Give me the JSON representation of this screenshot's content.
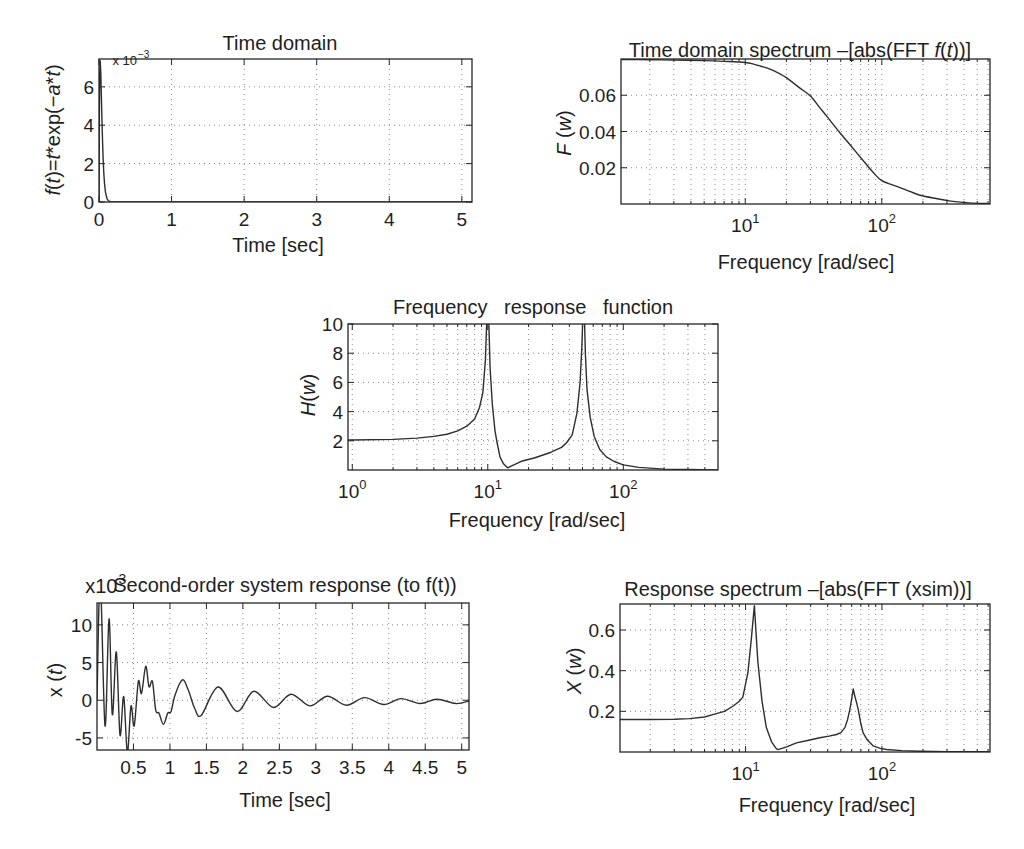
{
  "style": {
    "background": "#ffffff",
    "line_color": "#2e2e2e",
    "axes_color": "#262626",
    "grid_color": "#8a8a8a",
    "text_color": "#1e1e1e"
  },
  "chart_data": [
    {
      "id": "time-domain",
      "type": "line",
      "title": "Time domain",
      "title_rich": [
        [
          "Time domain",
          0
        ]
      ],
      "xlabel": "Time [sec]",
      "ylabel": "f(t)=t*exp(−a*t)",
      "ylabel_rich": [
        [
          "f",
          1
        ],
        [
          "(",
          0
        ],
        [
          "t",
          1
        ],
        [
          ")=",
          0
        ],
        [
          "t",
          1
        ],
        [
          "*exp(−",
          0
        ],
        [
          "a",
          1
        ],
        [
          "*",
          0
        ],
        [
          "t",
          1
        ],
        [
          ")",
          0
        ]
      ],
      "y_multiplier": {
        "base": "x 10",
        "exp": "−3"
      },
      "xscale": "linear",
      "yscale": "linear",
      "xlim": [
        0,
        5.14
      ],
      "ylim": [
        0,
        7.45
      ],
      "xticks": [
        0,
        1,
        2,
        3,
        4,
        5
      ],
      "xticklabels": [
        "0",
        "1",
        "2",
        "3",
        "4",
        "5"
      ],
      "yticks": [
        0,
        2,
        4,
        6
      ],
      "yticklabels": [
        "0",
        "2",
        "4",
        "6"
      ],
      "grid": true,
      "series": [
        {
          "name": "f(t) (x10^-3)",
          "smooth": false,
          "x": [
            0,
            0.005,
            0.01,
            0.0167,
            0.025,
            0.035,
            0.045,
            0.055,
            0.065,
            0.075,
            0.09,
            0.11,
            0.13,
            0.16,
            0.2,
            0.3,
            1,
            2,
            3,
            4,
            5,
            5.14
          ],
          "y": [
            0,
            4.47,
            6.62,
            7.36,
            6.73,
            5.17,
            3.65,
            2.45,
            1.59,
            1.0,
            0.49,
            0.18,
            0.064,
            0.013,
            0.002,
            0,
            0,
            0,
            0,
            0,
            0,
            0
          ]
        }
      ]
    },
    {
      "id": "time-domain-spectrum",
      "type": "line",
      "title": "Time domain spectrum –[abs(FFT f(t))]",
      "title_rich": [
        [
          "Time domain spectrum –[abs(FFT ",
          0
        ],
        [
          "f",
          1
        ],
        [
          "(",
          0
        ],
        [
          "t",
          1
        ],
        [
          "))]",
          0
        ]
      ],
      "xlabel": "Frequency [rad/sec]",
      "ylabel": "F (w)",
      "ylabel_rich": [
        [
          "F",
          1
        ],
        [
          " (",
          0
        ],
        [
          "w",
          1
        ],
        [
          ")",
          0
        ]
      ],
      "xscale": "log",
      "yscale": "linear",
      "xlim": [
        1.23,
        620
      ],
      "ylim": [
        0,
        0.08
      ],
      "xticks": [
        10,
        100
      ],
      "xticklabels": [
        {
          "base": "10",
          "exp": "1"
        },
        {
          "base": "10",
          "exp": "2"
        }
      ],
      "yticks": [
        0.02,
        0.04,
        0.06
      ],
      "yticklabels": [
        "0.02",
        "0.04",
        "0.06"
      ],
      "grid": true,
      "series": [
        {
          "name": "F(w)",
          "smooth": true,
          "x": [
            1.23,
            2,
            3,
            5,
            7,
            10,
            11.5,
            13,
            15,
            17.5,
            20,
            25,
            30,
            35,
            40,
            49,
            60,
            75,
            86,
            100,
            130,
            160,
            191,
            250,
            320,
            437,
            620
          ],
          "y": [
            0.0797,
            0.0796,
            0.0794,
            0.0791,
            0.0787,
            0.0781,
            0.0772,
            0.076,
            0.0745,
            0.0722,
            0.0697,
            0.0641,
            0.0596,
            0.0533,
            0.0479,
            0.0396,
            0.0317,
            0.0229,
            0.0176,
            0.0129,
            0.0096,
            0.007,
            0.0048,
            0.003,
            0.0016,
            0.0006,
            0.0002
          ]
        }
      ]
    },
    {
      "id": "frequency-response-function",
      "type": "line",
      "title": "Frequency   response   function",
      "title_rich": [
        [
          "Frequency   response   function",
          0
        ]
      ],
      "xlabel": "Frequency [rad/sec]",
      "ylabel": "H(w)",
      "ylabel_rich": [
        [
          "H",
          1
        ],
        [
          "(",
          0
        ],
        [
          "w",
          1
        ],
        [
          ")",
          0
        ]
      ],
      "xscale": "log",
      "yscale": "linear",
      "xlim": [
        0.93,
        500
      ],
      "ylim": [
        0,
        10
      ],
      "xticks": [
        1,
        10,
        100
      ],
      "xticklabels": [
        {
          "base": "10",
          "exp": "0"
        },
        {
          "base": "10",
          "exp": "1"
        },
        {
          "base": "10",
          "exp": "2"
        }
      ],
      "yticks": [
        2,
        4,
        6,
        8,
        10
      ],
      "yticklabels": [
        "2",
        "4",
        "6",
        "8",
        "10"
      ],
      "grid": true,
      "series": [
        {
          "name": "H(w)",
          "smooth": false,
          "x": [
            0.93,
            1,
            2,
            3,
            4,
            5,
            6,
            7,
            8,
            8.7,
            9.2,
            9.6,
            9.85,
            10,
            10.15,
            10.4,
            10.8,
            11.3,
            11.7,
            12.3,
            13,
            14,
            15,
            16,
            18,
            22,
            29,
            35,
            38,
            42,
            45.5,
            48,
            49.5,
            50.5,
            51,
            51.5,
            52.5,
            54,
            57,
            61,
            67,
            75,
            85,
            100,
            130,
            200,
            300,
            500
          ],
          "y": [
            2.05,
            2.05,
            2.1,
            2.18,
            2.3,
            2.45,
            2.68,
            3.0,
            3.5,
            4.3,
            5.3,
            7.5,
            10.5,
            16,
            10.5,
            7,
            4.5,
            2.7,
            1.9,
            0.9,
            0.45,
            0.15,
            0.28,
            0.4,
            0.62,
            0.82,
            1.2,
            1.55,
            1.85,
            2.4,
            3.9,
            6,
            8.5,
            11,
            16,
            11,
            8,
            5.5,
            3.6,
            2.3,
            1.4,
            0.9,
            0.6,
            0.35,
            0.18,
            0.06,
            0.03,
            0.01
          ]
        }
      ]
    },
    {
      "id": "second-order-system-response",
      "type": "line",
      "title": "Second-order system response (to f(t))",
      "title_rich": [
        [
          "Second-order system response (to f(t))",
          0
        ]
      ],
      "title_prefix": {
        "base": "x10",
        "exp": "3"
      },
      "xlabel": "Time [sec]",
      "ylabel": "x (t)",
      "ylabel_rich": [
        [
          "x (",
          0
        ],
        [
          "t",
          1
        ],
        [
          ")",
          0
        ]
      ],
      "xscale": "linear",
      "yscale": "linear",
      "xlim": [
        0,
        5.1
      ],
      "ylim": [
        -6.6,
        12.9
      ],
      "xticks": [
        0.5,
        1,
        1.5,
        2,
        2.5,
        3,
        3.5,
        4,
        4.5,
        5
      ],
      "xticklabels": [
        "0.5",
        "1",
        "1.5",
        "2",
        "2.5",
        "3",
        "3.5",
        "4",
        "4.5",
        "5"
      ],
      "yticks": [
        -5,
        0,
        5,
        10
      ],
      "yticklabels": [
        "-5",
        "0",
        "5",
        "10"
      ],
      "grid": true,
      "series": [
        {
          "name": "x(t) (x10^3)",
          "smooth": true,
          "x": [
            0,
            0.045,
            0.11,
            0.165,
            0.21,
            0.265,
            0.315,
            0.366,
            0.416,
            0.466,
            0.51,
            0.567,
            0.61,
            0.668,
            0.713,
            0.76,
            0.805,
            0.85,
            0.91,
            0.97,
            1.015,
            1.07,
            1.17,
            1.25,
            1.34,
            1.43,
            1.66,
            1.92,
            2.15,
            2.42,
            2.66,
            2.92,
            3.16,
            3.42,
            3.67,
            3.93,
            4.17,
            4.43,
            4.66,
            4.92,
            5.1
          ],
          "y": [
            0,
            16,
            -3.4,
            10.8,
            -1.9,
            6.4,
            -4.6,
            0.5,
            -6.9,
            -0.8,
            -3.4,
            2.5,
            0.9,
            4.5,
            1.8,
            2.5,
            -1.3,
            -1.7,
            -3.2,
            -1.7,
            -1.5,
            0.7,
            2.7,
            1.4,
            -1.1,
            -2.0,
            1.75,
            -1.5,
            1.2,
            -0.96,
            0.8,
            -0.75,
            0.53,
            -0.66,
            0.35,
            -0.57,
            0.22,
            -0.44,
            0.13,
            -0.44,
            -0.1
          ]
        }
      ]
    },
    {
      "id": "response-spectrum",
      "type": "line",
      "title": "Response spectrum –[abs(FFT (xsim))]",
      "title_rich": [
        [
          "Response spectrum –[abs(FFT (xsim))]",
          0
        ]
      ],
      "xlabel": "Frequency [rad/sec]",
      "ylabel": "X (w)",
      "ylabel_rich": [
        [
          "X",
          1
        ],
        [
          " (",
          0
        ],
        [
          "w",
          1
        ],
        [
          ")",
          0
        ]
      ],
      "xscale": "log",
      "yscale": "linear",
      "xlim": [
        1.2,
        620
      ],
      "ylim": [
        0,
        0.728
      ],
      "xticks": [
        10,
        100
      ],
      "xticklabels": [
        {
          "base": "10",
          "exp": "1"
        },
        {
          "base": "10",
          "exp": "2"
        }
      ],
      "yticks": [
        0.2,
        0.4,
        0.6
      ],
      "yticklabels": [
        "0.2",
        "0.4",
        "0.6"
      ],
      "grid": true,
      "series": [
        {
          "name": "X(w)",
          "smooth": false,
          "x": [
            1.2,
            2,
            3,
            3.87,
            5,
            5.75,
            7,
            8.07,
            9,
            9.55,
            10.4,
            11,
            11.6,
            12.3,
            13.2,
            14.2,
            15.5,
            16.8,
            17.3,
            20,
            23.6,
            29,
            35,
            41,
            46.4,
            50,
            53.5,
            56,
            58.2,
            60.3,
            61.6,
            63,
            65,
            67,
            70,
            72.8,
            78,
            86.3,
            97,
            108,
            140,
            191,
            300,
            620
          ],
          "y": [
            0.16,
            0.16,
            0.161,
            0.164,
            0.172,
            0.184,
            0.2,
            0.225,
            0.25,
            0.27,
            0.39,
            0.55,
            0.72,
            0.445,
            0.25,
            0.12,
            0.05,
            0.017,
            0.012,
            0.025,
            0.045,
            0.058,
            0.07,
            0.078,
            0.086,
            0.095,
            0.12,
            0.16,
            0.21,
            0.27,
            0.31,
            0.28,
            0.245,
            0.21,
            0.14,
            0.094,
            0.06,
            0.03,
            0.018,
            0.012,
            0.007,
            0.004,
            0.002,
            0.001
          ]
        }
      ]
    }
  ]
}
